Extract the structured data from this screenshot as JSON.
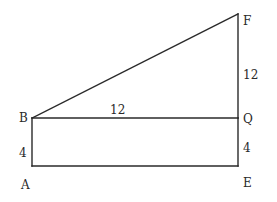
{
  "diagram": {
    "type": "geometry",
    "points": {
      "A": {
        "label": "A",
        "x": 32,
        "y": 166
      },
      "B": {
        "label": "B",
        "x": 32,
        "y": 118
      },
      "Q": {
        "label": "Q",
        "x": 238,
        "y": 118
      },
      "E": {
        "label": "E",
        "x": 238,
        "y": 166
      },
      "F": {
        "label": "F",
        "x": 238,
        "y": 14
      }
    },
    "segments": [
      {
        "from": "B",
        "to": "F"
      },
      {
        "from": "F",
        "to": "Q"
      },
      {
        "from": "Q",
        "to": "E"
      },
      {
        "from": "B",
        "to": "Q"
      },
      {
        "from": "B",
        "to": "A"
      },
      {
        "from": "A",
        "to": "E"
      }
    ],
    "measurements": {
      "AB": "4",
      "BQ": "12",
      "QF": "12",
      "QE": "4"
    },
    "colors": {
      "line": "#2a2a2a",
      "background": "#ffffff"
    }
  }
}
